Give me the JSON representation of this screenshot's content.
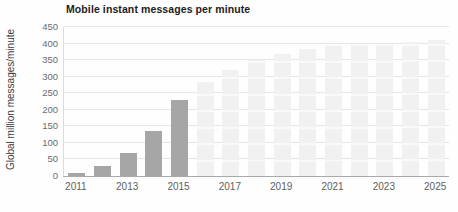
{
  "chart_data": {
    "type": "bar",
    "title": "Mobile instant messages per minute",
    "xlabel": "",
    "ylabel": "Global million messages/minute",
    "ylim": [
      0,
      450
    ],
    "grid": true,
    "legend": "none",
    "categories": [
      "2011",
      "2012",
      "2013",
      "2014",
      "2015",
      "2016",
      "2017",
      "2018",
      "2019",
      "2020",
      "2021",
      "2022",
      "2023",
      "2024",
      "2025"
    ],
    "series": [
      {
        "name": "Actual",
        "color": "#a6a6a6",
        "values": [
          10,
          30,
          70,
          135,
          230,
          null,
          null,
          null,
          null,
          null,
          null,
          null,
          null,
          null,
          null
        ]
      },
      {
        "name": "Forecast",
        "color": "#f1f1f1",
        "values": [
          null,
          null,
          null,
          null,
          null,
          285,
          320,
          350,
          370,
          385,
          395,
          400,
          400,
          405,
          410
        ]
      }
    ],
    "y_ticks": [
      0,
      50,
      100,
      150,
      200,
      250,
      300,
      350,
      400,
      450
    ],
    "x_axis_tick_labels": [
      "2011",
      "2013",
      "2015",
      "2017",
      "2019",
      "2021",
      "2023",
      "2025"
    ]
  }
}
